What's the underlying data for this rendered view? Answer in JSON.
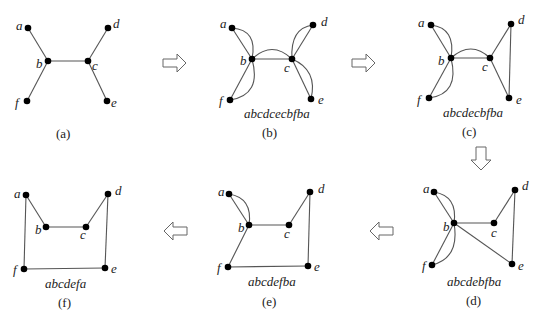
{
  "panels": [
    {
      "id": "a",
      "caption": "(a)",
      "walk": ""
    },
    {
      "id": "b",
      "caption": "(b)",
      "walk": "abcdcecbfba"
    },
    {
      "id": "c",
      "caption": "(c)",
      "walk": "abcdecbfba"
    },
    {
      "id": "d",
      "caption": "(d)",
      "walk": "abcdebfba"
    },
    {
      "id": "e",
      "caption": "(e)",
      "walk": "abcdefba"
    },
    {
      "id": "f",
      "caption": "(f)",
      "walk": "abcdefa"
    }
  ],
  "vertex_labels": {
    "a": "a",
    "b": "b",
    "c": "c",
    "d": "d",
    "e": "e",
    "f": "f"
  },
  "arrows": [
    {
      "from": "a",
      "to": "b",
      "direction": "right"
    },
    {
      "from": "b",
      "to": "c",
      "direction": "right"
    },
    {
      "from": "c",
      "to": "d",
      "direction": "down"
    },
    {
      "from": "d",
      "to": "e",
      "direction": "left"
    },
    {
      "from": "e",
      "to": "f",
      "direction": "left"
    }
  ]
}
